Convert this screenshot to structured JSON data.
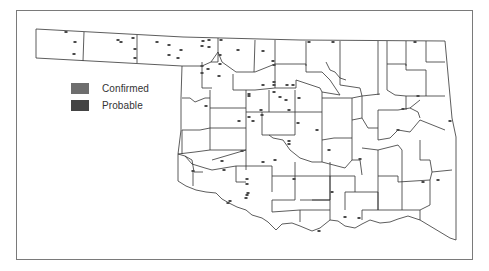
{
  "map": {
    "region": "Oklahoma counties",
    "outline_color": "#333333",
    "frame_color": "#7a7a7a",
    "marker_color": "#4a4a4a"
  },
  "legend": {
    "items": [
      {
        "label": "Confirmed",
        "color": "#6e6e6e"
      },
      {
        "label": "Probable",
        "color": "#444444"
      }
    ]
  },
  "markers": [
    [
      66,
      32
    ],
    [
      75,
      42
    ],
    [
      74,
      54
    ],
    [
      118,
      40
    ],
    [
      121,
      42
    ],
    [
      133,
      38
    ],
    [
      135,
      49
    ],
    [
      135,
      58
    ],
    [
      157,
      42
    ],
    [
      169,
      45
    ],
    [
      169,
      55
    ],
    [
      181,
      50
    ],
    [
      178,
      58
    ],
    [
      203,
      41
    ],
    [
      209,
      40
    ],
    [
      202,
      46
    ],
    [
      209,
      47
    ],
    [
      221,
      40
    ],
    [
      220,
      55
    ],
    [
      202,
      66
    ],
    [
      208,
      69
    ],
    [
      202,
      73
    ],
    [
      220,
      64
    ],
    [
      219,
      76
    ],
    [
      238,
      50
    ],
    [
      263,
      51
    ],
    [
      273,
      61
    ],
    [
      274,
      65
    ],
    [
      274,
      82
    ],
    [
      274,
      85
    ],
    [
      263,
      85
    ],
    [
      287,
      85
    ],
    [
      293,
      85
    ],
    [
      249,
      94
    ],
    [
      249,
      96
    ],
    [
      274,
      92
    ],
    [
      280,
      97
    ],
    [
      286,
      100
    ],
    [
      289,
      110
    ],
    [
      299,
      98
    ],
    [
      261,
      110
    ],
    [
      262,
      115
    ],
    [
      249,
      117
    ],
    [
      253,
      121
    ],
    [
      239,
      121
    ],
    [
      206,
      106
    ],
    [
      298,
      123
    ],
    [
      317,
      130
    ],
    [
      289,
      141
    ],
    [
      289,
      144
    ],
    [
      329,
      150
    ],
    [
      360,
      159
    ],
    [
      263,
      162
    ],
    [
      275,
      160
    ],
    [
      242,
      151
    ],
    [
      222,
      161
    ],
    [
      224,
      170
    ],
    [
      193,
      171
    ],
    [
      247,
      179
    ],
    [
      247,
      184
    ],
    [
      248,
      193
    ],
    [
      246,
      198
    ],
    [
      247,
      195
    ],
    [
      294,
      179
    ],
    [
      228,
      203
    ],
    [
      230,
      201
    ],
    [
      309,
      42
    ],
    [
      333,
      42
    ],
    [
      415,
      42
    ],
    [
      418,
      96
    ],
    [
      403,
      109
    ],
    [
      398,
      130
    ],
    [
      450,
      121
    ],
    [
      423,
      182
    ],
    [
      438,
      180
    ],
    [
      332,
      192
    ],
    [
      345,
      217
    ],
    [
      359,
      218
    ],
    [
      319,
      231
    ]
  ]
}
